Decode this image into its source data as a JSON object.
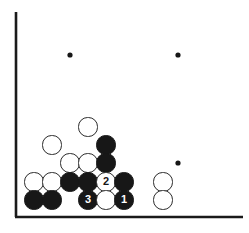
{
  "diagram": {
    "kind": "go-board-diagram",
    "board": {
      "cols": 13,
      "rows": 12,
      "origin_x": 16,
      "origin_y": 19,
      "spacing": 18,
      "line_color": "#8a8a8a",
      "border_color": "#1a1a1a",
      "background_color": "#ffffff",
      "left_border": true,
      "bottom_border": true,
      "fade_right": true,
      "fade_top": true
    },
    "colors": {
      "black": "#171717",
      "white": "#ffffff",
      "stone_outline": "#2a2a2a",
      "label_on_black": "#ffffff",
      "label_on_white": "#171717"
    },
    "star_points": [
      {
        "x": 70,
        "y": 55
      },
      {
        "x": 178,
        "y": 55
      },
      {
        "x": 178,
        "y": 163
      }
    ],
    "stones": [
      {
        "id": "w-a",
        "color": "white",
        "x": 88,
        "y": 127,
        "label": ""
      },
      {
        "id": "w-b",
        "color": "white",
        "x": 52,
        "y": 145,
        "label": ""
      },
      {
        "id": "b-a",
        "color": "black",
        "x": 106,
        "y": 145,
        "label": ""
      },
      {
        "id": "w-c",
        "color": "white",
        "x": 70,
        "y": 163,
        "label": ""
      },
      {
        "id": "w-d",
        "color": "white",
        "x": 88,
        "y": 163,
        "label": ""
      },
      {
        "id": "b-b",
        "color": "black",
        "x": 106,
        "y": 163,
        "label": ""
      },
      {
        "id": "w-e",
        "color": "white",
        "x": 34,
        "y": 182,
        "label": ""
      },
      {
        "id": "w-f",
        "color": "white",
        "x": 52,
        "y": 182,
        "label": ""
      },
      {
        "id": "b-c",
        "color": "black",
        "x": 70,
        "y": 182,
        "label": ""
      },
      {
        "id": "b-d",
        "color": "black",
        "x": 88,
        "y": 182,
        "label": ""
      },
      {
        "id": "w-move-2",
        "color": "white",
        "x": 106,
        "y": 182,
        "label": "2"
      },
      {
        "id": "b-e",
        "color": "black",
        "x": 124,
        "y": 182,
        "label": ""
      },
      {
        "id": "w-g",
        "color": "white",
        "x": 163,
        "y": 182,
        "label": ""
      },
      {
        "id": "b-f",
        "color": "black",
        "x": 34,
        "y": 200,
        "label": ""
      },
      {
        "id": "b-g",
        "color": "black",
        "x": 52,
        "y": 200,
        "label": ""
      },
      {
        "id": "b-move-3",
        "color": "black",
        "x": 88,
        "y": 200,
        "label": "3"
      },
      {
        "id": "w-h",
        "color": "white",
        "x": 106,
        "y": 200,
        "label": ""
      },
      {
        "id": "b-move-1",
        "color": "black",
        "x": 124,
        "y": 200,
        "label": "1"
      },
      {
        "id": "w-i",
        "color": "white",
        "x": 163,
        "y": 200,
        "label": ""
      }
    ],
    "stone_radius": 9.6,
    "move_sequence": [
      {
        "number": "1",
        "color": "black"
      },
      {
        "number": "2",
        "color": "white"
      },
      {
        "number": "3",
        "color": "black"
      }
    ]
  }
}
